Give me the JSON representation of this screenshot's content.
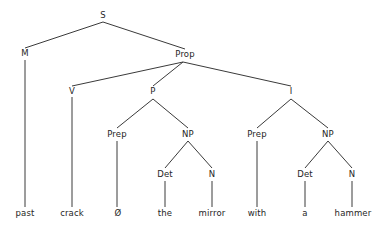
{
  "figure": {
    "kind": "syntax-tree",
    "sentence": "past crack Ø the mirror with a hammer",
    "background_color": "#ffffff",
    "line_color": "#3a3a3a",
    "text_color": "#262626"
  },
  "nodes": {
    "s": {
      "label": "S",
      "x": 103,
      "y": 18
    },
    "m": {
      "label": "M",
      "x": 25,
      "y": 56
    },
    "prop": {
      "label": "Prop",
      "x": 185,
      "y": 57
    },
    "v": {
      "label": "V",
      "x": 72,
      "y": 94
    },
    "p": {
      "label": "P",
      "x": 153,
      "y": 94
    },
    "i": {
      "label": "I",
      "x": 291,
      "y": 94
    },
    "prep_left": {
      "label": "Prep",
      "x": 117,
      "y": 137
    },
    "np_left": {
      "label": "NP",
      "x": 188,
      "y": 137
    },
    "prep_right": {
      "label": "Prep",
      "x": 257,
      "y": 137
    },
    "np_right": {
      "label": "NP",
      "x": 328,
      "y": 137
    },
    "det_left": {
      "label": "Det",
      "x": 165,
      "y": 177
    },
    "n_left": {
      "label": "N",
      "x": 212,
      "y": 177
    },
    "det_right": {
      "label": "Det",
      "x": 305,
      "y": 177
    },
    "n_right": {
      "label": "N",
      "x": 352,
      "y": 177
    }
  },
  "leaves": {
    "past": {
      "label": "past",
      "x": 25,
      "y": 216
    },
    "crack": {
      "label": "crack",
      "x": 72,
      "y": 216
    },
    "zero": {
      "label": "Ø",
      "x": 118,
      "y": 216
    },
    "the": {
      "label": "the",
      "x": 165,
      "y": 216
    },
    "mirror": {
      "label": "mirror",
      "x": 212,
      "y": 216
    },
    "with": {
      "label": "with",
      "x": 257,
      "y": 216
    },
    "a": {
      "label": "a",
      "x": 305,
      "y": 216
    },
    "hammer": {
      "label": "hammer",
      "x": 353,
      "y": 216
    }
  },
  "edges": [
    {
      "name": "edge-s-m",
      "x1": 103,
      "y1": 22,
      "x2": 25,
      "y2": 48
    },
    {
      "name": "edge-s-prop",
      "x1": 103,
      "y1": 22,
      "x2": 185,
      "y2": 49
    },
    {
      "name": "edge-m-past",
      "x1": 25,
      "y1": 60,
      "x2": 25,
      "y2": 207
    },
    {
      "name": "edge-prop-v",
      "x1": 183,
      "y1": 62,
      "x2": 72,
      "y2": 86
    },
    {
      "name": "edge-prop-p",
      "x1": 183,
      "y1": 62,
      "x2": 153,
      "y2": 86
    },
    {
      "name": "edge-prop-i",
      "x1": 183,
      "y1": 62,
      "x2": 291,
      "y2": 86
    },
    {
      "name": "edge-v-crack",
      "x1": 72,
      "y1": 97,
      "x2": 72,
      "y2": 207
    },
    {
      "name": "edge-p-prep-left",
      "x1": 153,
      "y1": 99,
      "x2": 117,
      "y2": 128
    },
    {
      "name": "edge-p-np-left",
      "x1": 153,
      "y1": 99,
      "x2": 188,
      "y2": 128
    },
    {
      "name": "edge-i-prep-right",
      "x1": 291,
      "y1": 99,
      "x2": 257,
      "y2": 128
    },
    {
      "name": "edge-i-np-right",
      "x1": 291,
      "y1": 99,
      "x2": 328,
      "y2": 128
    },
    {
      "name": "edge-prep-left-zero",
      "x1": 117,
      "y1": 141,
      "x2": 117,
      "y2": 207
    },
    {
      "name": "edge-np-left-det",
      "x1": 188,
      "y1": 141,
      "x2": 165,
      "y2": 168
    },
    {
      "name": "edge-np-left-n",
      "x1": 188,
      "y1": 141,
      "x2": 212,
      "y2": 168
    },
    {
      "name": "edge-prep-right-with",
      "x1": 257,
      "y1": 141,
      "x2": 257,
      "y2": 207
    },
    {
      "name": "edge-np-right-det",
      "x1": 328,
      "y1": 141,
      "x2": 305,
      "y2": 168
    },
    {
      "name": "edge-np-right-n",
      "x1": 328,
      "y1": 141,
      "x2": 352,
      "y2": 168
    },
    {
      "name": "edge-det-left-the",
      "x1": 165,
      "y1": 181,
      "x2": 165,
      "y2": 207
    },
    {
      "name": "edge-n-left-mirror",
      "x1": 212,
      "y1": 181,
      "x2": 212,
      "y2": 207
    },
    {
      "name": "edge-det-right-a",
      "x1": 305,
      "y1": 181,
      "x2": 305,
      "y2": 207
    },
    {
      "name": "edge-n-right-hammer",
      "x1": 352,
      "y1": 181,
      "x2": 352,
      "y2": 207
    }
  ]
}
